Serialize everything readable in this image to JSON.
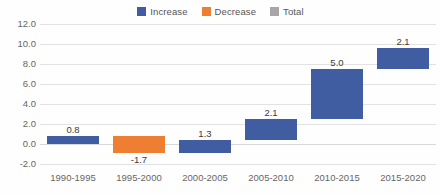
{
  "chart_data": {
    "type": "bar",
    "subtype": "waterfall",
    "title": "",
    "xlabel": "",
    "ylabel": "",
    "categories": [
      "1990-1995",
      "1995-2000",
      "2000-2005",
      "2005-2010",
      "2010-2015",
      "2015-2020"
    ],
    "values": [
      0.8,
      -1.7,
      1.3,
      2.1,
      5.0,
      2.1
    ],
    "data_labels": [
      "0.8",
      "-1.7",
      "1.3",
      "2.1",
      "5.0",
      "2.1"
    ],
    "bar_kinds": [
      "increase",
      "decrease",
      "increase",
      "increase",
      "increase",
      "increase"
    ],
    "cumulative_start": [
      0.0,
      0.8,
      -0.9,
      0.4,
      2.5,
      7.5
    ],
    "cumulative_end": [
      0.8,
      -0.9,
      0.4,
      2.5,
      7.5,
      9.6
    ],
    "ylim": [
      -2.0,
      12.0
    ],
    "ytick_step": 2.0,
    "ytick_labels": [
      "12.0",
      "10.0",
      "8.0",
      "6.0",
      "4.0",
      "2.0",
      "0.0",
      "-2.0"
    ],
    "ytick_values": [
      12.0,
      10.0,
      8.0,
      6.0,
      4.0,
      2.0,
      0.0,
      -2.0
    ],
    "grid": true,
    "legend_position": "top-center",
    "legend": [
      {
        "label": "Increase",
        "color": "#3f5da0"
      },
      {
        "label": "Decrease",
        "color": "#ee7e31"
      },
      {
        "label": "Total",
        "color": "#a6a6a6"
      }
    ],
    "colors": {
      "increase": "#3f5da0",
      "decrease": "#ee7e31",
      "total": "#a6a6a6",
      "gridline": "#e2e2e2",
      "axis_text": "#666666",
      "label_text": "#3a3a3a",
      "background": "#fefefe"
    }
  }
}
